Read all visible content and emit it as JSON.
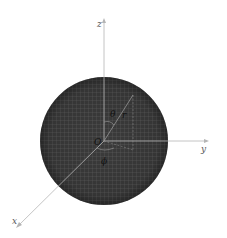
{
  "diagram": {
    "type": "spherical-coordinates",
    "sphere": {
      "cx": 104,
      "cy": 141,
      "r": 64,
      "fill": "#3a3a3a",
      "mesh_color": "#8a8a8a"
    },
    "axes": {
      "z": {
        "label": "z",
        "x1": 104,
        "y1": 141,
        "x2": 104,
        "y2": 20
      },
      "y": {
        "label": "y",
        "x1": 104,
        "y1": 141,
        "x2": 207,
        "y2": 141
      },
      "x": {
        "label": "x",
        "x1": 104,
        "y1": 141,
        "x2": 18,
        "y2": 226
      }
    },
    "axis_color": "#b0b0b0",
    "labels": {
      "origin": "O",
      "theta": "θ",
      "r": "r",
      "phi": "ϕ"
    }
  }
}
